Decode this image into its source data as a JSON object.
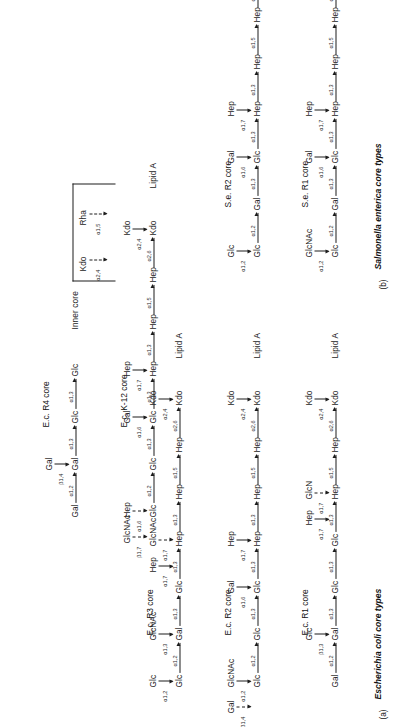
{
  "figure": {
    "page_header": "",
    "panels": [
      {
        "id": "a",
        "letter": "(a)",
        "title": "Escherichia coli core types"
      },
      {
        "id": "b",
        "letter": "(b)",
        "title": "Salmonella enterica core types"
      }
    ],
    "labels": {
      "inner_core": "Inner core",
      "lipid_a": "Lipid A"
    }
  },
  "cores": [
    {
      "id": "ec-r1",
      "name": "E.c. R1 core",
      "panel": "a",
      "backbone": [
        {
          "sugar": "Gal"
        },
        {
          "sugar": "Gal",
          "link": "α1,2"
        },
        {
          "sugar": "Glc",
          "link": "α1,3"
        },
        {
          "sugar": "Glc",
          "link": "α1,3"
        },
        {
          "sugar": "Hep",
          "link": "α1,3"
        },
        {
          "sugar": "Hep",
          "link": "α1,5"
        },
        {
          "sugar": "Kdo",
          "link": "α2,6"
        },
        {
          "sugar": "Lipid A"
        }
      ],
      "branches": [
        {
          "sugar": "Glc",
          "link": "β1,3",
          "dashed": false,
          "onto": 1
        },
        {
          "sugar": "GlcN",
          "link": "α1,7",
          "dashed": true,
          "onto": 4
        },
        {
          "sugar": "Hep",
          "link": "α1,7",
          "dashed": false,
          "onto": 4
        },
        {
          "sugar": "Kdo",
          "link": "α2,4",
          "dashed": false,
          "onto": 6
        }
      ]
    },
    {
      "id": "ec-r2",
      "name": "E.c. R2 core",
      "panel": "a",
      "backbone": [
        {
          "sugar": "Glc"
        },
        {
          "sugar": "Glc",
          "link": "α1,2"
        },
        {
          "sugar": "Glc",
          "link": "α1,3"
        },
        {
          "sugar": "Hep",
          "link": "α1,3"
        },
        {
          "sugar": "Hep",
          "link": "α1,3"
        },
        {
          "sugar": "Hep",
          "link": "α1,5"
        },
        {
          "sugar": "Kdo",
          "link": "α2,6"
        },
        {
          "sugar": "Lipid A"
        }
      ],
      "branches": [
        {
          "sugar": "GlcNAc",
          "link": "α1,2",
          "dashed": false,
          "onto": 0
        },
        {
          "sugar": "Gal",
          "link": "β1,4",
          "dashed": true,
          "onto": 0
        },
        {
          "sugar": "Gal",
          "link": "α1,6",
          "dashed": false,
          "onto": 2
        },
        {
          "sugar": "Hep",
          "link": "α1,7",
          "dashed": false,
          "onto": 3
        },
        {
          "sugar": "Kdo",
          "link": "α2,4",
          "dashed": false,
          "onto": 6
        }
      ]
    },
    {
      "id": "ec-r3",
      "name": "E.c. R3 core",
      "panel": "a",
      "backbone": [
        {
          "sugar": "Glc"
        },
        {
          "sugar": "Gal",
          "link": "α1,2"
        },
        {
          "sugar": "Glc",
          "link": "α1,3"
        },
        {
          "sugar": "Hep",
          "link": "α1,3"
        },
        {
          "sugar": "Hep",
          "link": "α1,3"
        },
        {
          "sugar": "Hep",
          "link": "α1,5"
        },
        {
          "sugar": "Kdo",
          "link": "α2,6"
        },
        {
          "sugar": "Lipid A"
        }
      ],
      "branches": [
        {
          "sugar": "Glc",
          "link": "α1,2",
          "dashed": false,
          "onto": 0
        },
        {
          "sugar": "GlcNAc",
          "link": "α1,3",
          "dashed": false,
          "onto": 1
        },
        {
          "sugar": "GlcNAc",
          "link": "α1,7",
          "dashed": true,
          "onto": 3
        },
        {
          "sugar": "Hep",
          "link": "α1,7",
          "dashed": false,
          "onto": 3
        },
        {
          "sugar": "Kdo",
          "link": "α2,4",
          "dashed": false,
          "onto": 6
        }
      ]
    },
    {
      "id": "ec-r4",
      "name": "E.c. R4 core",
      "panel": "a",
      "backbone": [
        {
          "sugar": "Gal"
        },
        {
          "sugar": "Gal",
          "link": "α1,2"
        },
        {
          "sugar": "Glc",
          "link": "α1,3"
        },
        {
          "sugar": "Glc",
          "link": "α1,3"
        },
        {
          "sugar": "Inner core"
        }
      ],
      "branches": [
        {
          "sugar": "Gal",
          "link": "β1,4",
          "dashed": false,
          "onto": 1
        }
      ]
    },
    {
      "id": "ec-k12",
      "name": "E.c. K-12 core",
      "panel": "a",
      "backbone": [
        {
          "sugar": "Glc"
        },
        {
          "sugar": "Glc",
          "link": "α1,2"
        },
        {
          "sugar": "Glc",
          "link": "α1,3"
        },
        {
          "sugar": "Hep",
          "link": "α1,3"
        },
        {
          "sugar": "Hep",
          "link": "α1,3"
        },
        {
          "sugar": "Hep",
          "link": "α1,5"
        },
        {
          "sugar": "Kdo",
          "link": "α2,6"
        },
        {
          "sugar": "Lipid A"
        }
      ],
      "branches": [
        {
          "sugar": "Hep",
          "link": "α1,6",
          "dashed": true,
          "onto": 0
        },
        {
          "sugar": "GlcNAc",
          "link": "β1,7",
          "dashed": true,
          "onto": 0
        },
        {
          "sugar": "Gal",
          "link": "α1,6",
          "dashed": false,
          "onto": 2
        },
        {
          "sugar": "Hep",
          "link": "α1,7",
          "dashed": false,
          "onto": 3
        },
        {
          "sugar": "Kdo",
          "link": "α2,4",
          "dashed": false,
          "onto": 6
        }
      ],
      "bracket_substituents": [
        {
          "sugar": "Kdo",
          "link": "α2,4",
          "dashed": true
        },
        {
          "sugar": "Rha",
          "link": "α1,5",
          "dashed": true
        }
      ]
    },
    {
      "id": "se-r1",
      "name": "S.e. R1 core",
      "panel": "b",
      "backbone": [
        {
          "sugar": "Glc"
        },
        {
          "sugar": "Gal",
          "link": "α1,2"
        },
        {
          "sugar": "Glc",
          "link": "α1,3"
        },
        {
          "sugar": "Hep",
          "link": "α1,3"
        },
        {
          "sugar": "Hep",
          "link": "α1,3"
        },
        {
          "sugar": "Hep",
          "link": "α1,5"
        },
        {
          "sugar": "Kdo",
          "link": "α2,6"
        },
        {
          "sugar": "Lipid A"
        }
      ],
      "branches": [
        {
          "sugar": "GlcNAc",
          "link": "α1,2",
          "dashed": false,
          "onto": 0
        },
        {
          "sugar": "Gal",
          "link": "α1,6",
          "dashed": false,
          "onto": 2
        },
        {
          "sugar": "Hep",
          "link": "α1,7",
          "dashed": false,
          "onto": 3
        },
        {
          "sugar": "Kdo",
          "link": "α2,4",
          "dashed": true,
          "onto": 6
        }
      ]
    },
    {
      "id": "se-r2",
      "name": "S.e. R2 core",
      "panel": "b",
      "backbone": [
        {
          "sugar": "Glc"
        },
        {
          "sugar": "Gal",
          "link": "α1,2"
        },
        {
          "sugar": "Glc",
          "link": "α1,3"
        },
        {
          "sugar": "Hep",
          "link": "α1,3"
        },
        {
          "sugar": "Hep",
          "link": "α1,3"
        },
        {
          "sugar": "Hep",
          "link": "α1,5"
        },
        {
          "sugar": "Kdo",
          "link": "α2,6"
        },
        {
          "sugar": "Lipid A"
        }
      ],
      "branches": [
        {
          "sugar": "Glc",
          "link": "α1,2",
          "dashed": false,
          "onto": 0
        },
        {
          "sugar": "Gal",
          "link": "α1,6",
          "dashed": false,
          "onto": 2
        },
        {
          "sugar": "Hep",
          "link": "α1,7",
          "dashed": false,
          "onto": 3
        },
        {
          "sugar": "Kdo",
          "link": "α2,4",
          "dashed": false,
          "onto": 6
        }
      ]
    }
  ]
}
